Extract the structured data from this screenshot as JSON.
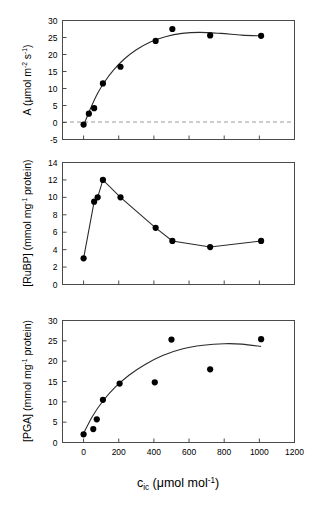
{
  "figure": {
    "background": "#ffffff",
    "marker_color": "#000000",
    "curve_color": "#2b2b2b",
    "axis_color": "#4a4a4a",
    "zeroline_color": "#9a9a9a",
    "xaxis": {
      "label_main": "c",
      "label_sub": "ic",
      "label_units_pre": " (μmol mol",
      "label_units_sup": "-1",
      "label_units_post": ")",
      "full_label": "c_ic (μmol mol-1)",
      "ticks": [
        0,
        200,
        400,
        600,
        800,
        1000,
        1200
      ],
      "tick_labels": [
        "0",
        "200",
        "400",
        "600",
        "800",
        "1000",
        "1200"
      ],
      "min": -120,
      "max": 1200
    }
  },
  "chart_data": [
    {
      "type": "scatter",
      "panel": "top",
      "title": "",
      "xlabel": "c_ic (μmol mol-1)",
      "ylabel": "A (μmol m-2 s-1)",
      "ylabel_parts": {
        "main": "A (μmol m",
        "sup1": "-2",
        "mid": " s",
        "sup2": "-1",
        "post": ")"
      },
      "ylim": [
        -5,
        30
      ],
      "xlim": [
        -120,
        1200
      ],
      "yticks": [
        -5,
        0,
        5,
        10,
        15,
        20,
        25,
        30
      ],
      "ytick_labels": [
        "-5",
        "0",
        "5",
        "10",
        "15",
        "20",
        "25",
        "30"
      ],
      "grid": false,
      "legend": "none",
      "zero_reference_line": 0,
      "x": [
        0,
        30,
        60,
        110,
        210,
        410,
        505,
        720,
        1010
      ],
      "y": [
        -0.6,
        2.6,
        4.2,
        11.5,
        16.4,
        24.0,
        27.5,
        25.6,
        25.5
      ],
      "fit_curve": {
        "description": "saturating rectangular-hyperbola-like fit with slight decline",
        "x": [
          0,
          40,
          80,
          120,
          170,
          230,
          300,
          380,
          470,
          560,
          660,
          780,
          900,
          1010
        ],
        "y": [
          -0.8,
          4.2,
          8.6,
          12.0,
          15.4,
          18.6,
          21.4,
          23.7,
          25.3,
          26.2,
          26.5,
          26.2,
          25.7,
          25.5
        ]
      },
      "connect_points": false
    },
    {
      "type": "line",
      "panel": "middle",
      "title": "",
      "xlabel": "c_ic (μmol mol-1)",
      "ylabel": "[RuBP] (mmol mg-1 protein)",
      "ylabel_parts": {
        "main": "[RuBP] (mmol mg",
        "sup1": "-1",
        "post": " protein)"
      },
      "ylim": [
        0,
        14
      ],
      "xlim": [
        -120,
        1200
      ],
      "yticks": [
        0,
        2,
        4,
        6,
        8,
        10,
        12,
        14
      ],
      "ytick_labels": [
        "0",
        "2",
        "4",
        "6",
        "8",
        "10",
        "12",
        "14"
      ],
      "grid": false,
      "legend": "none",
      "x": [
        0,
        60,
        80,
        110,
        210,
        410,
        505,
        720,
        1010
      ],
      "y": [
        3.0,
        9.5,
        10.0,
        12.0,
        10.0,
        6.5,
        5.0,
        4.3,
        5.0
      ],
      "connect_points": true
    },
    {
      "type": "scatter",
      "panel": "bottom",
      "title": "",
      "xlabel": "c_ic (μmol mol-1)",
      "ylabel": "[PGA] (mmol mg-1 protein)",
      "ylabel_parts": {
        "main": "[PGA] (mmol mg",
        "sup1": "-1",
        "post": " protein)"
      },
      "ylim": [
        0,
        30
      ],
      "xlim": [
        -120,
        1200
      ],
      "yticks": [
        0,
        5,
        10,
        15,
        20,
        25,
        30
      ],
      "ytick_labels": [
        "0",
        "5",
        "10",
        "15",
        "20",
        "25",
        "30"
      ],
      "grid": false,
      "legend": "none",
      "x": [
        0,
        55,
        75,
        110,
        205,
        405,
        500,
        720,
        1010
      ],
      "y": [
        2.0,
        3.3,
        5.7,
        10.5,
        14.5,
        14.8,
        25.3,
        18.0,
        25.4
      ],
      "fit_curve": {
        "description": "concave saturating quadratic-like fit peaking near 900",
        "x": [
          -10,
          50,
          110,
          180,
          260,
          350,
          450,
          560,
          680,
          800,
          900,
          1010
        ],
        "y": [
          1.4,
          6.4,
          10.2,
          13.6,
          16.6,
          19.2,
          21.4,
          23.0,
          23.9,
          24.3,
          24.2,
          23.6
        ]
      },
      "connect_points": false
    }
  ]
}
